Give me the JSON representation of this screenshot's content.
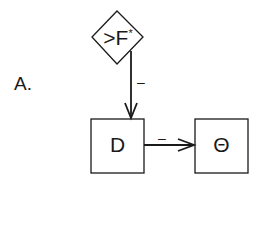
{
  "panel": {
    "label": "A."
  },
  "nodes": {
    "feedback": {
      "label": ">F",
      "superscript": "*",
      "shape": "diamond"
    },
    "d": {
      "label": "D",
      "shape": "square"
    },
    "theta": {
      "label": "Θ",
      "shape": "square"
    }
  },
  "edges": [
    {
      "from": "feedback",
      "to": "d",
      "sign": "–"
    },
    {
      "from": "d",
      "to": "theta",
      "sign": "–"
    }
  ],
  "colors": {
    "stroke": "#1a1a1a",
    "background": "#ffffff"
  }
}
